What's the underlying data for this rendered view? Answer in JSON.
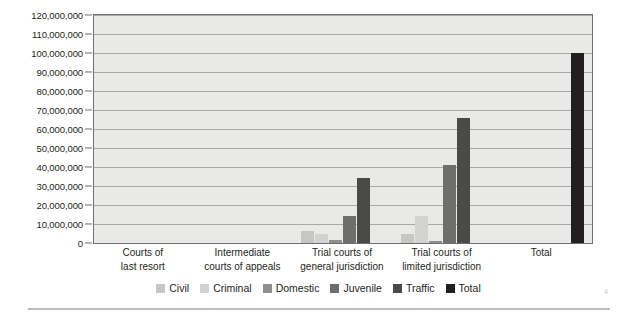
{
  "chart_data": {
    "type": "bar",
    "title": "",
    "subtitle": "",
    "xlabel": "",
    "ylabel": "",
    "ylim": [
      0,
      120000000
    ],
    "ytick_step": 10000000,
    "ytick_labels": [
      "0",
      "10,000,000",
      "20,000,000",
      "30,000,000",
      "40,000,000",
      "50,000,000",
      "60,000,000",
      "70,000,000",
      "80,000,000",
      "90,000,000",
      "100,000,000",
      "110,000,000",
      "120,000,000"
    ],
    "ytick_values": [
      0,
      10000000,
      20000000,
      30000000,
      40000000,
      50000000,
      60000000,
      70000000,
      80000000,
      90000000,
      100000000,
      110000000,
      120000000
    ],
    "grid": true,
    "grid_axis": "y",
    "legend_position": "bottom",
    "categories": [
      "Courts of\nlast resort",
      "Intermediate\ncourts of appeals",
      "Trial courts of\ngeneral jurisdiction",
      "Trial courts of\nlimited jurisdiction",
      "Total"
    ],
    "category_lines": [
      [
        "Courts of",
        "last resort"
      ],
      [
        "Intermediate",
        "courts of appeals"
      ],
      [
        "Trial courts of",
        "general jurisdiction"
      ],
      [
        "Trial courts of",
        "limited jurisdiction"
      ],
      [
        "Total"
      ]
    ],
    "series": [
      {
        "name": "Civil",
        "color": "#c6c6c4",
        "values": [
          0,
          0,
          6500000,
          5000000,
          0
        ]
      },
      {
        "name": "Criminal",
        "color": "#d2d2d0",
        "values": [
          0,
          0,
          4500000,
          14000000,
          0
        ]
      },
      {
        "name": "Domestic",
        "color": "#8f8f8d",
        "values": [
          0,
          0,
          1600000,
          1000000,
          0
        ]
      },
      {
        "name": "Juvenile",
        "color": "#6e6e6c",
        "values": [
          0,
          0,
          14000000,
          41000000,
          0
        ]
      },
      {
        "name": "Traffic",
        "color": "#4a4a48",
        "values": [
          0,
          0,
          34000000,
          66000000,
          0
        ]
      },
      {
        "name": "Total",
        "color": "#231f20",
        "values": [
          0,
          0,
          0,
          0,
          100000000
        ]
      }
    ]
  },
  "legend": {
    "items": [
      {
        "label": "Civil"
      },
      {
        "label": "Criminal"
      },
      {
        "label": "Domestic"
      },
      {
        "label": "Juvenile"
      },
      {
        "label": "Traffic"
      },
      {
        "label": "Total"
      }
    ]
  },
  "colors": {
    "plot_background": "#e9e9e7",
    "plot_border": "#6f6f6f",
    "gridline": "#a9a9a6",
    "text": "#231f20",
    "page_background": "#ffffff",
    "rule": "#bdbdbd"
  },
  "footer": {
    "corner_mark": "4"
  }
}
